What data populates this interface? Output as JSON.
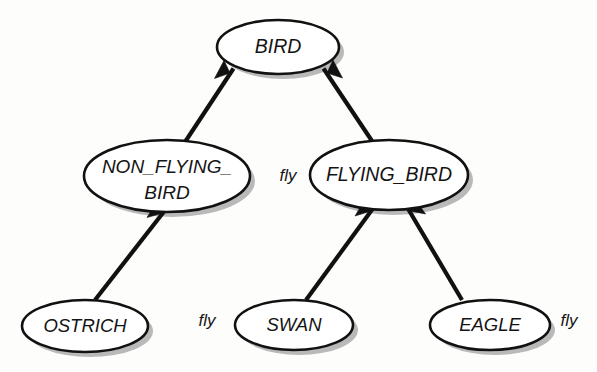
{
  "diagram": {
    "type": "inheritance-hierarchy",
    "background_color": "#fdfdfc",
    "node_fill_color": "#ffffff",
    "node_stroke_color": "#111111",
    "shadow_color": "#b9b9b9",
    "edge_color": "#111111",
    "nodes": [
      {
        "id": "bird",
        "label": "BIRD",
        "lines": [
          "BIRD"
        ],
        "shape": "ellipse",
        "cx": 278,
        "cy": 47,
        "rx": 61,
        "ry": 27
      },
      {
        "id": "non_flying_bird",
        "label": "NON_FLYING_BIRD",
        "lines": [
          "NON_FLYING_",
          "BIRD"
        ],
        "shape": "ellipse",
        "cx": 167,
        "cy": 176,
        "rx": 83,
        "ry": 36
      },
      {
        "id": "flying_bird",
        "label": "FLYING_BIRD",
        "lines": [
          "FLYING_BIRD"
        ],
        "shape": "ellipse",
        "cx": 389,
        "cy": 175,
        "rx": 79,
        "ry": 35
      },
      {
        "id": "ostrich",
        "label": "OSTRICH",
        "lines": [
          "OSTRICH"
        ],
        "shape": "ellipse",
        "cx": 85,
        "cy": 326,
        "rx": 63,
        "ry": 26
      },
      {
        "id": "swan",
        "label": "SWAN",
        "lines": [
          "SWAN"
        ],
        "shape": "ellipse",
        "cx": 294,
        "cy": 325,
        "rx": 59,
        "ry": 25
      },
      {
        "id": "eagle",
        "label": "EAGLE",
        "lines": [
          "EAGLE"
        ],
        "shape": "ellipse",
        "cx": 490,
        "cy": 325,
        "rx": 60,
        "ry": 25
      }
    ],
    "edges": [
      {
        "id": "edge-non-flying-bird-to-bird",
        "from": "non_flying_bird",
        "to": "bird",
        "arrow": "solid-triangle",
        "x1": 185,
        "y1": 142,
        "x2": 230,
        "y2": 73
      },
      {
        "id": "edge-flying-bird-to-bird",
        "from": "flying_bird",
        "to": "bird",
        "arrow": "solid-triangle",
        "x1": 372,
        "y1": 141,
        "x2": 327,
        "y2": 73
      },
      {
        "id": "edge-ostrich-to-non-flying-bird",
        "from": "ostrich",
        "to": "non_flying_bird",
        "arrow": "solid-triangle",
        "x1": 95,
        "y1": 300,
        "x2": 163,
        "y2": 213
      },
      {
        "id": "edge-swan-to-flying-bird",
        "from": "swan",
        "to": "flying_bird",
        "arrow": "solid-triangle",
        "x1": 306,
        "y1": 300,
        "x2": 371,
        "y2": 211
      },
      {
        "id": "edge-eagle-to-flying-bird",
        "from": "eagle",
        "to": "flying_bird",
        "arrow": "solid-triangle",
        "x1": 462,
        "y1": 300,
        "x2": 410,
        "y2": 211
      }
    ],
    "edge_labels": [
      {
        "id": "fly-label-flying-bird",
        "text": "fly",
        "attached_to": "flying_bird",
        "x": 288,
        "y": 177
      },
      {
        "id": "fly-label-swan",
        "text": "fly",
        "attached_to": "swan",
        "x": 207,
        "y": 322
      },
      {
        "id": "fly-label-eagle",
        "text": "fly",
        "attached_to": "eagle",
        "x": 569,
        "y": 322
      }
    ]
  }
}
